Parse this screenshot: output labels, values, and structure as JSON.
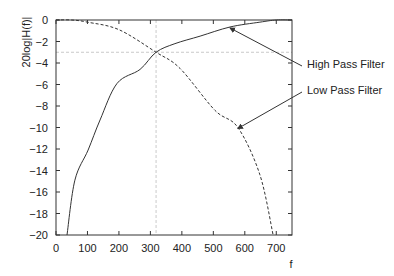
{
  "chart_data": {
    "type": "line",
    "title": "",
    "xlabel": "f",
    "ylabel": "20log|H(f)|",
    "xlim": [
      0,
      750
    ],
    "ylim": [
      -20,
      0
    ],
    "xticks": [
      0,
      100,
      200,
      300,
      400,
      500,
      600,
      700
    ],
    "yticks": [
      0,
      -2,
      -4,
      -6,
      -8,
      -10,
      -12,
      -14,
      -16,
      -18,
      -20
    ],
    "grid": false,
    "legend": "none (arrow annotations)",
    "reference_lines": [
      {
        "orientation": "horizontal",
        "y": -3,
        "style": "dashed",
        "color": "#bbbbbb"
      },
      {
        "orientation": "vertical",
        "x": 318,
        "style": "dashed",
        "color": "#bbbbbb"
      }
    ],
    "series": [
      {
        "name": "High Pass Filter",
        "style": "solid",
        "x": [
          35,
          60,
          102,
          140,
          194,
          267,
          318,
          378,
          458,
          553,
          648,
          700,
          750
        ],
        "y": [
          -20,
          -14.9,
          -12.1,
          -9.3,
          -5.9,
          -4.6,
          -3,
          -2.2,
          -1.5,
          -0.65,
          -0.2,
          0,
          0
        ]
      },
      {
        "name": "Low Pass Filter",
        "style": "dashed",
        "x": [
          0,
          50,
          100,
          200,
          318,
          394,
          505,
          578,
          648,
          690
        ],
        "y": [
          0,
          0,
          -0.2,
          -0.9,
          -3,
          -4.5,
          -8.4,
          -10,
          -14.4,
          -20
        ]
      }
    ],
    "annotations": [
      {
        "text": "High Pass Filter",
        "arrow_to": {
          "f": 553,
          "db": -0.65
        }
      },
      {
        "text": "Low Pass Filter",
        "arrow_to": {
          "f": 578,
          "db": -10
        }
      }
    ]
  },
  "labels": {
    "ylabel": "20log|H(f)|",
    "xlabel": "f",
    "high_pass": "High Pass Filter",
    "low_pass": "Low Pass Filter"
  },
  "colors": {
    "axis": "#333333",
    "curve": "#333333",
    "reference": "#bbbbbb"
  }
}
